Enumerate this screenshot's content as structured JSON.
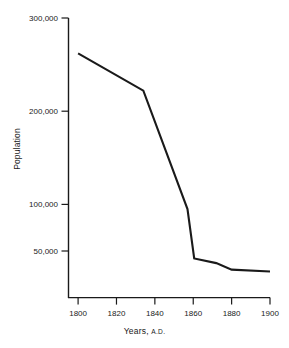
{
  "chart_data": {
    "type": "line",
    "title": "",
    "subtitle": "",
    "xlabel": "Years, A.D.",
    "xlabel_main": "Years,",
    "xlabel_smallcaps": "A.D.",
    "ylabel": "Population",
    "xlim": [
      1795,
      1900
    ],
    "ylim": [
      0,
      300000
    ],
    "grid": false,
    "legend": false,
    "legend_position": "none",
    "x_ticks": [
      1800,
      1820,
      1840,
      1860,
      1880,
      1900
    ],
    "x_tick_labels": [
      "1800",
      "1820",
      "1840",
      "1860",
      "1880",
      "1900"
    ],
    "y_ticks": [
      50000,
      100000,
      200000,
      300000
    ],
    "y_tick_labels": [
      "50,000",
      "100,000",
      "200,000",
      "300,000"
    ],
    "line_color": "#1a1a1a",
    "line_width": 2.1,
    "x": [
      1800,
      1834,
      1857,
      1860.5,
      1872,
      1880,
      1900
    ],
    "values": [
      262000,
      222000,
      95000,
      42000,
      37000,
      30000,
      28000
    ],
    "series": [
      {
        "name": "Population",
        "x": [
          1800,
          1834,
          1857,
          1860.5,
          1872,
          1880,
          1900
        ],
        "values": [
          262000,
          222000,
          95000,
          42000,
          37000,
          30000,
          28000
        ]
      }
    ],
    "annotations": []
  },
  "axes": {
    "spine_color": "#1a1a1a",
    "background": "#ffffff"
  }
}
